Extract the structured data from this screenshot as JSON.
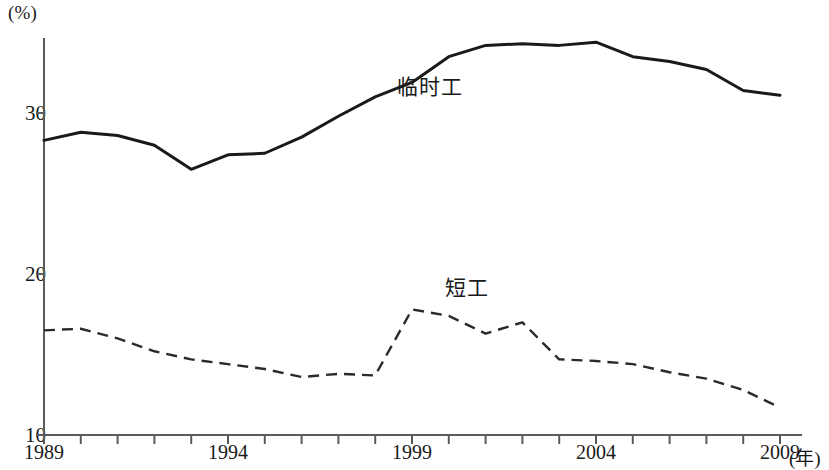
{
  "chart_data": {
    "type": "line",
    "title": "",
    "xlabel": "年",
    "ylabel": "(%)",
    "x": [
      1989,
      1990,
      1991,
      1992,
      1993,
      1994,
      1995,
      1996,
      1997,
      1998,
      1999,
      2000,
      2001,
      2002,
      2003,
      2004,
      2005,
      2006,
      2007,
      2008,
      2009
    ],
    "xlim": [
      1989,
      2009
    ],
    "ylim": [
      10,
      35.5
    ],
    "yticks": [
      10,
      20,
      30
    ],
    "xticks_labeled": [
      1989,
      1994,
      1999,
      2004,
      2009
    ],
    "xtick_interval": 1,
    "grid": false,
    "legend": "inline-annotations",
    "series": [
      {
        "name": "临时工",
        "style": "solid",
        "color": "#1a1a1a",
        "values": [
          28.3,
          28.8,
          28.6,
          28.0,
          26.5,
          27.4,
          27.5,
          28.5,
          29.8,
          31.0,
          31.9,
          33.5,
          34.2,
          34.3,
          34.2,
          34.4,
          33.5,
          33.2,
          32.7,
          31.4,
          31.1
        ]
      },
      {
        "name": "短工",
        "style": "dashed",
        "color": "#2a2a2a",
        "values": [
          16.5,
          16.6,
          16.0,
          15.2,
          14.7,
          14.4,
          14.1,
          13.6,
          13.8,
          13.7,
          17.8,
          17.4,
          16.3,
          17.0,
          14.7,
          14.6,
          14.4,
          13.9,
          13.5,
          12.8,
          11.7
        ]
      }
    ],
    "annotations": [
      {
        "text": "临时工",
        "x": 1998.6,
        "y": 31.8
      },
      {
        "text": "短工",
        "x": 1999.9,
        "y": 19.3
      }
    ]
  },
  "axis": {
    "unit_y": "(%)",
    "unit_x": "(年)",
    "ytick_labels": [
      "30",
      "20",
      "10"
    ],
    "xtick_labels": [
      "1989",
      "1994",
      "1999",
      "2004",
      "2009"
    ]
  }
}
